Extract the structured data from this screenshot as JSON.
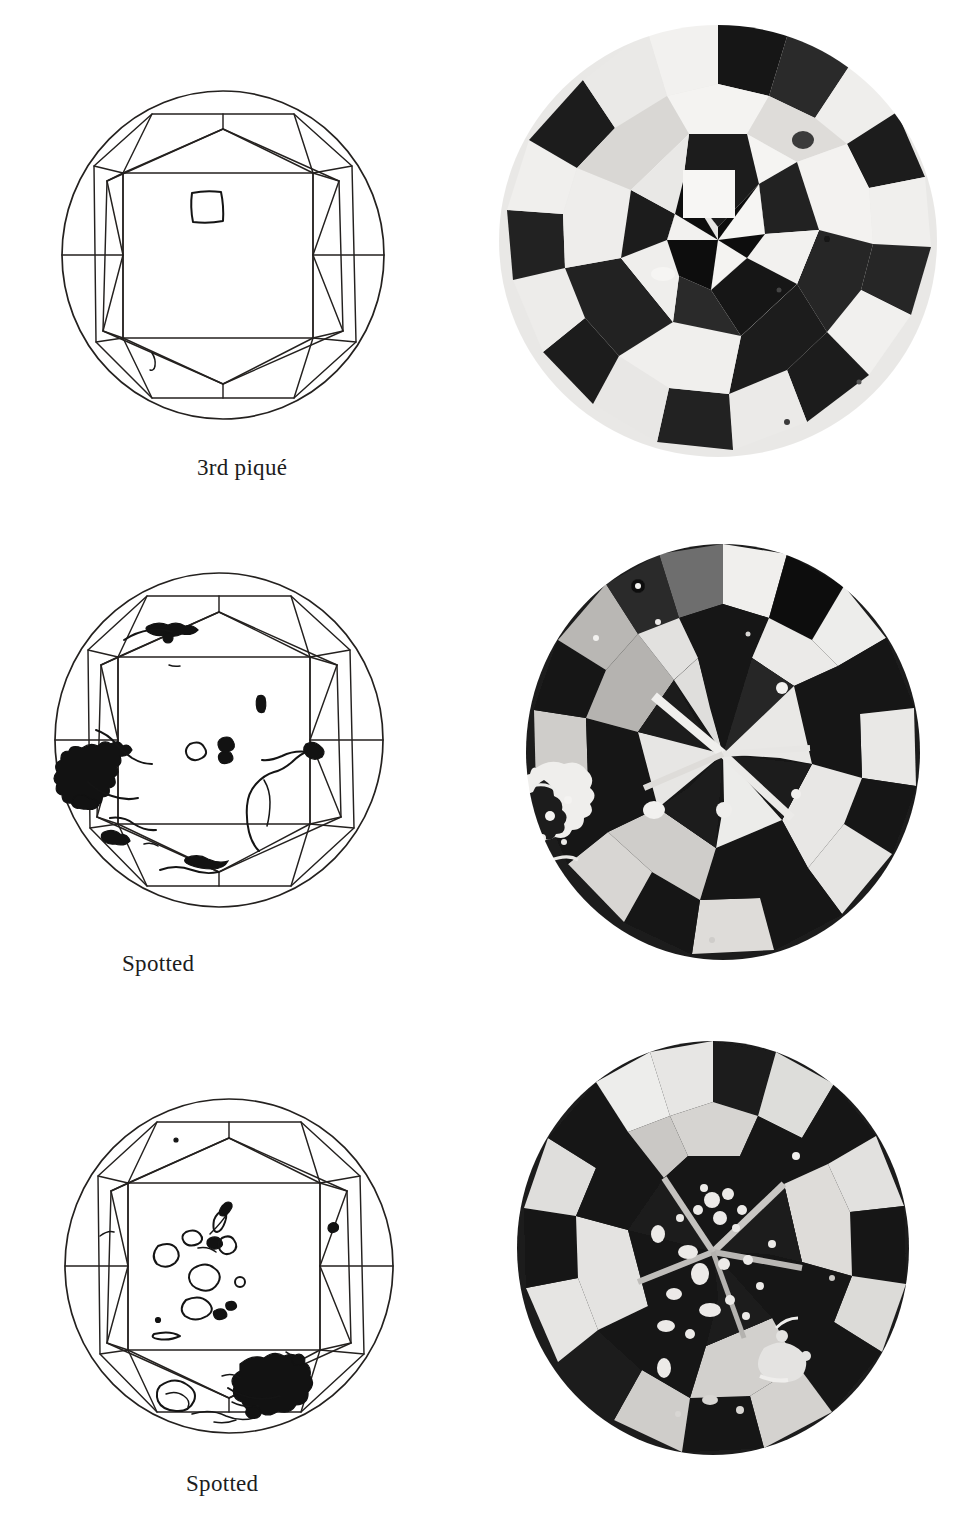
{
  "page": {
    "background_color": "#ffffff",
    "ink_color": "#1a1a1a",
    "width": 977,
    "height": 1522,
    "kind": "book-plate"
  },
  "plates": [
    {
      "id": "plate-1",
      "caption": "3rd piqué",
      "diagram": {
        "name": "round-brilliant-clarity-plot",
        "view": "crown",
        "inclusion_summary": "single square outlined inclusion on the table, small hook mark near lower-left girdle",
        "inclusion_count": 2
      },
      "photo": {
        "name": "diamond-photomicrograph",
        "tone": "high-contrast black and white",
        "feature": "bright square inclusion at center of table"
      }
    },
    {
      "id": "plate-2",
      "caption": "Spotted",
      "diagram": {
        "name": "round-brilliant-clarity-plot",
        "view": "crown",
        "inclusion_summary": "heavy irregular cloud along the left girdle and lower-left, scattered small spots across the table",
        "inclusion_count": 12
      },
      "photo": {
        "name": "diamond-photomicrograph",
        "tone": "dark high-contrast black and white",
        "feature": "white feathered cloud at left edge with scattered white pinpoints"
      }
    },
    {
      "id": "plate-3",
      "caption": "Spotted",
      "diagram": {
        "name": "round-brilliant-clarity-plot",
        "view": "crown",
        "inclusion_summary": "many small outlined blobs scattered over the table with a dense solid black cluster at lower right",
        "inclusion_count": 18
      },
      "photo": {
        "name": "diamond-photomicrograph",
        "tone": "dark high-contrast black and white",
        "feature": "numerous white spot inclusions clustered across the dark table area"
      }
    }
  ],
  "layout": {
    "diagram_column_center_x": 222,
    "photo_column_center_x": 718,
    "row_tops": [
      22,
      530,
      1035
    ]
  }
}
